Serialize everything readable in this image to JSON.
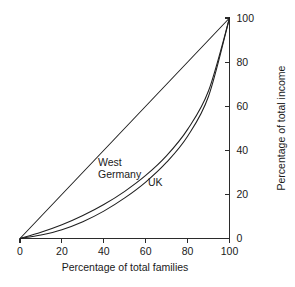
{
  "chart_data": {
    "type": "line",
    "title": "",
    "subtitle": "",
    "xlabel": "Percentage of total families",
    "ylabel": "Percentage of total income",
    "xlim": [
      0,
      100
    ],
    "ylim": [
      0,
      100
    ],
    "xticks": [
      "0",
      "20",
      "40",
      "60",
      "80",
      "100"
    ],
    "yticks": [
      "0",
      "20",
      "40",
      "60",
      "80",
      "100"
    ],
    "xtick_values": [
      0,
      20,
      40,
      60,
      80,
      100
    ],
    "ytick_values": [
      0,
      20,
      40,
      60,
      80,
      100
    ],
    "grid": false,
    "legend_position": "inline-annotation",
    "y_axis_side": "right",
    "x": [
      0,
      10,
      20,
      30,
      40,
      50,
      60,
      70,
      80,
      90,
      100
    ],
    "series": [
      {
        "name": "line of equality",
        "label_shown": "",
        "values": [
          0,
          10,
          20,
          30,
          40,
          50,
          60,
          70,
          80,
          90,
          100
        ]
      },
      {
        "name": "West Germany",
        "label_shown": "West Germany",
        "values": [
          0,
          2.8,
          6.2,
          10.4,
          15.4,
          21.4,
          28.6,
          37.6,
          49.5,
          67.0,
          100
        ]
      },
      {
        "name": "UK",
        "label_shown": "UK",
        "values": [
          0,
          1.6,
          4.0,
          7.6,
          12.4,
          18.4,
          25.6,
          34.6,
          46.4,
          64.5,
          100
        ]
      }
    ],
    "annotations": [
      {
        "name": "west-germany-label",
        "text_line1": "West",
        "text_line2": "Germany",
        "x_px": 98,
        "y_px": 166
      },
      {
        "name": "uk-label",
        "text_line1": "UK",
        "text_line2": "",
        "x_px": 148,
        "y_px": 186
      }
    ]
  }
}
